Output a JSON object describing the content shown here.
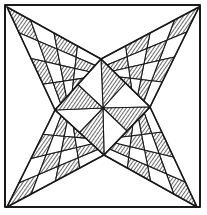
{
  "image": {
    "kind": "quilt-block-line-drawing",
    "description": "Four-pointed star quilt block with checkered diamond arms and central pinwheel of hatched triangles",
    "colors": {
      "ink": "#1a1a1a",
      "paper": "#ffffff"
    },
    "border": {
      "x": 5,
      "y": 5,
      "w": 195,
      "h": 202
    },
    "center": [
      103,
      108
    ],
    "star_tips": [
      [
        7,
        7
      ],
      [
        199,
        7
      ],
      [
        197,
        207
      ],
      [
        7,
        207
      ]
    ],
    "inner_diamond": {
      "top": [
        101,
        59
      ],
      "right": [
        150,
        107
      ],
      "bottom": [
        104,
        155
      ],
      "left": [
        55,
        110
      ]
    }
  }
}
